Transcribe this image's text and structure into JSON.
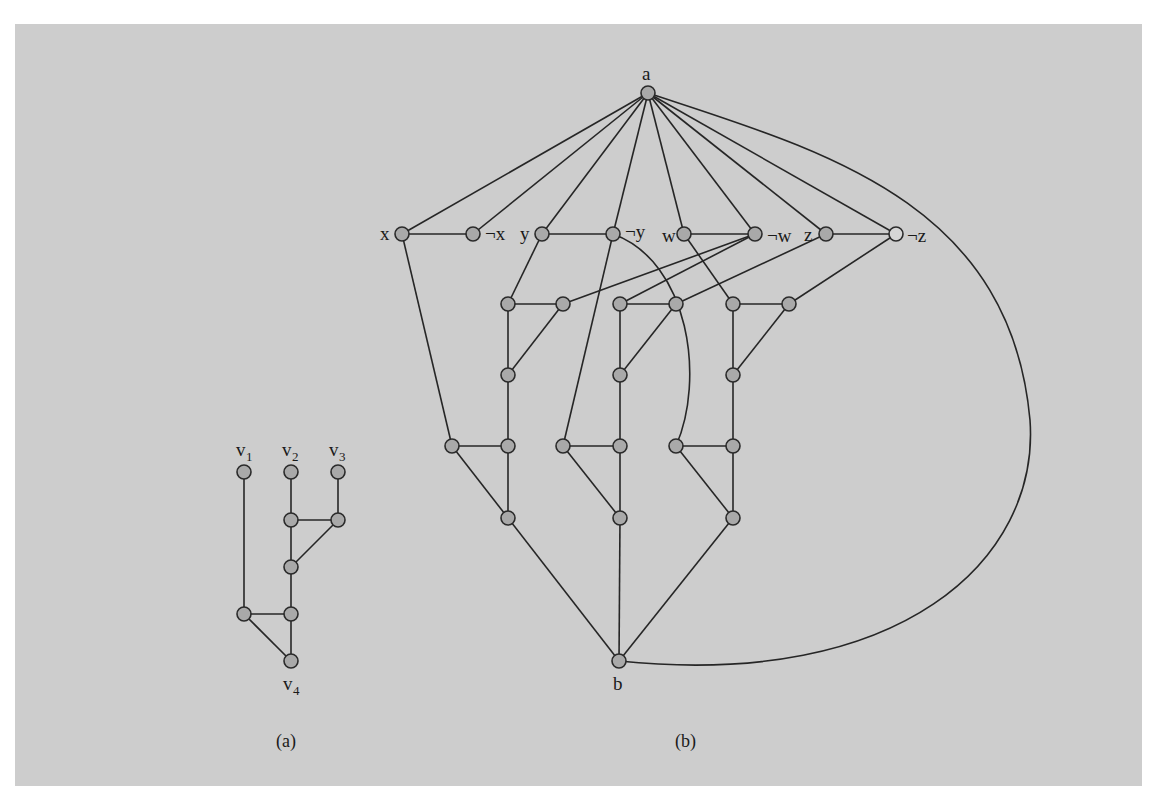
{
  "figure": {
    "background_color": "#cdcdcd",
    "node_color": "#a9a9a9",
    "edge_color": "#262626"
  },
  "panel_a": {
    "caption": "(a)",
    "labels": {
      "v1": {
        "base": "v",
        "sub": "1"
      },
      "v2": {
        "base": "v",
        "sub": "2"
      },
      "v3": {
        "base": "v",
        "sub": "3"
      },
      "v4": {
        "base": "v",
        "sub": "4"
      }
    },
    "nodes": [
      {
        "id": "v1",
        "x": 244,
        "y": 472
      },
      {
        "id": "v2",
        "x": 291,
        "y": 472
      },
      {
        "id": "v3",
        "x": 338,
        "y": 472
      },
      {
        "id": "a_n4",
        "x": 291,
        "y": 520
      },
      {
        "id": "a_n5",
        "x": 338,
        "y": 520
      },
      {
        "id": "a_n6",
        "x": 291,
        "y": 567
      },
      {
        "id": "a_n7",
        "x": 244,
        "y": 614
      },
      {
        "id": "a_n8",
        "x": 291,
        "y": 614
      },
      {
        "id": "v4",
        "x": 291,
        "y": 661
      }
    ],
    "edges": [
      [
        "v1",
        "a_n7"
      ],
      [
        "v2",
        "a_n4"
      ],
      [
        "v3",
        "a_n5"
      ],
      [
        "a_n4",
        "a_n5"
      ],
      [
        "a_n5",
        "a_n6"
      ],
      [
        "a_n4",
        "a_n6"
      ],
      [
        "a_n6",
        "a_n8"
      ],
      [
        "a_n7",
        "a_n8"
      ],
      [
        "a_n7",
        "v4"
      ],
      [
        "a_n8",
        "v4"
      ]
    ]
  },
  "panel_b": {
    "caption": "(b)",
    "labels": {
      "a": "a",
      "b": "b",
      "x": "x",
      "nx": "¬x",
      "y": "y",
      "ny": "¬y",
      "w": "w",
      "nw": "¬w",
      "z": "z",
      "nz": "¬z"
    },
    "nodes": [
      {
        "id": "a",
        "x": 648,
        "y": 93
      },
      {
        "id": "x",
        "x": 402,
        "y": 234
      },
      {
        "id": "nx",
        "x": 473,
        "y": 234
      },
      {
        "id": "y",
        "x": 542,
        "y": 234
      },
      {
        "id": "ny",
        "x": 613,
        "y": 234
      },
      {
        "id": "w",
        "x": 684,
        "y": 234
      },
      {
        "id": "nw",
        "x": 755,
        "y": 234
      },
      {
        "id": "z",
        "x": 826,
        "y": 234
      },
      {
        "id": "nz",
        "x": 896,
        "y": 234,
        "hollow": true
      },
      {
        "id": "g1_top",
        "x": 508,
        "y": 304
      },
      {
        "id": "g1_r",
        "x": 563,
        "y": 304
      },
      {
        "id": "g1_mid",
        "x": 508,
        "y": 375
      },
      {
        "id": "g1_l",
        "x": 452,
        "y": 446
      },
      {
        "id": "g1_bot",
        "x": 508,
        "y": 446
      },
      {
        "id": "g1_end",
        "x": 508,
        "y": 518
      },
      {
        "id": "g2_top",
        "x": 620,
        "y": 304
      },
      {
        "id": "g2_r",
        "x": 676,
        "y": 304
      },
      {
        "id": "g2_mid",
        "x": 620,
        "y": 375
      },
      {
        "id": "g2_l",
        "x": 563,
        "y": 446
      },
      {
        "id": "g2_bot",
        "x": 620,
        "y": 446
      },
      {
        "id": "g2_end",
        "x": 620,
        "y": 518
      },
      {
        "id": "g3_top",
        "x": 733,
        "y": 304
      },
      {
        "id": "g3_r",
        "x": 789,
        "y": 304
      },
      {
        "id": "g3_mid",
        "x": 733,
        "y": 375
      },
      {
        "id": "g3_l",
        "x": 676,
        "y": 446
      },
      {
        "id": "g3_bot",
        "x": 733,
        "y": 446
      },
      {
        "id": "g3_end",
        "x": 733,
        "y": 518
      },
      {
        "id": "b",
        "x": 619,
        "y": 661
      }
    ],
    "edges": [
      [
        "a",
        "x"
      ],
      [
        "a",
        "nx"
      ],
      [
        "a",
        "y"
      ],
      [
        "a",
        "ny"
      ],
      [
        "a",
        "w"
      ],
      [
        "a",
        "nw"
      ],
      [
        "a",
        "z"
      ],
      [
        "a",
        "nz"
      ],
      [
        "x",
        "nx"
      ],
      [
        "y",
        "ny"
      ],
      [
        "w",
        "nw"
      ],
      [
        "z",
        "nz"
      ],
      [
        "x",
        "g1_l"
      ],
      [
        "y",
        "g1_top"
      ],
      [
        "ny",
        "g2_l"
      ],
      [
        "w",
        "g3_top"
      ],
      [
        "nw",
        "g1_r"
      ],
      [
        "nw",
        "g2_top"
      ],
      [
        "z",
        "g2_r"
      ],
      [
        "nz",
        "g3_r"
      ],
      [
        "g1_top",
        "g1_r"
      ],
      [
        "g1_r",
        "g1_mid"
      ],
      [
        "g1_top",
        "g1_mid"
      ],
      [
        "g1_mid",
        "g1_bot"
      ],
      [
        "g1_l",
        "g1_bot"
      ],
      [
        "g1_bot",
        "g1_end"
      ],
      [
        "g1_l",
        "g1_end"
      ],
      [
        "g2_top",
        "g2_r"
      ],
      [
        "g2_r",
        "g2_mid"
      ],
      [
        "g2_top",
        "g2_mid"
      ],
      [
        "g2_mid",
        "g2_bot"
      ],
      [
        "g2_l",
        "g2_bot"
      ],
      [
        "g2_bot",
        "g2_end"
      ],
      [
        "g2_l",
        "g2_end"
      ],
      [
        "g3_top",
        "g3_r"
      ],
      [
        "g3_r",
        "g3_mid"
      ],
      [
        "g3_top",
        "g3_mid"
      ],
      [
        "g3_mid",
        "g3_bot"
      ],
      [
        "g3_l",
        "g3_bot"
      ],
      [
        "g3_bot",
        "g3_end"
      ],
      [
        "g3_l",
        "g3_end"
      ],
      [
        "g1_end",
        "b"
      ],
      [
        "g2_end",
        "b"
      ],
      [
        "g3_end",
        "b"
      ]
    ],
    "curved_edges": [
      {
        "from": "ny",
        "to": "g3_l",
        "path": "M613,234 C690,262 705,380 676,446"
      },
      {
        "from": "a",
        "to": "b",
        "path": "M648,93 C820,150 1010,200 1030,420 C1040,560 900,690 619,661"
      }
    ]
  }
}
